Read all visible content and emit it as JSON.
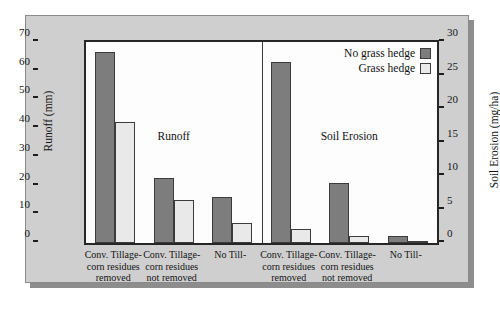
{
  "chart_data": {
    "type": "bar",
    "title": "",
    "panels": [
      {
        "name": "Runoff",
        "caption": "Runoff",
        "axis": "left",
        "categories": [
          "Conv. Tillage-\ncorn residues\nremoved",
          "Conv. Tillage-\ncorn residues\nnot removed",
          "No Till-"
        ],
        "series": [
          {
            "name": "No grass hedge",
            "values": [
              66.5,
              22.5,
              16.0
            ]
          },
          {
            "name": "Grass hedge",
            "values": [
              42.0,
              15.0,
              7.0
            ]
          }
        ]
      },
      {
        "name": "Soil Erosion",
        "caption": "Soil Erosion",
        "axis": "right",
        "categories": [
          "Conv. Tillage-\ncorn residues\nremoved",
          "Conv. Tillage-\ncorn residues\nnot removed",
          "No Till-"
        ],
        "series": [
          {
            "name": "No grass hedge",
            "values": [
              27.0,
              9.0,
              1.1
            ]
          },
          {
            "name": "Grass hedge",
            "values": [
              2.1,
              1.1,
              0.35
            ]
          }
        ]
      }
    ],
    "left_axis": {
      "label": "Runoff (mm)",
      "ticks": [
        0,
        10,
        20,
        30,
        40,
        50,
        60,
        70
      ],
      "lim": [
        0,
        70
      ],
      "units": "mm"
    },
    "right_axis": {
      "label": "Soil Erosion (mg/ha)",
      "ticks": [
        0,
        5,
        10,
        15,
        20,
        25,
        30
      ],
      "lim": [
        0,
        30
      ],
      "units": "mg/ha"
    },
    "legend": {
      "position": "top-right",
      "entries": [
        {
          "label": "No grass hedge",
          "color": "#7d7d7d"
        },
        {
          "label": "Grass hedge",
          "color": "#e9e9e9"
        }
      ]
    },
    "grid": false,
    "colors": {
      "no_grass_hedge": "#7d7d7d",
      "grass_hedge": "#e9e9e9",
      "panel_background": "#cfcfcf",
      "plot_background": "#fdfdfd",
      "axis": "#1d1d1d"
    }
  }
}
